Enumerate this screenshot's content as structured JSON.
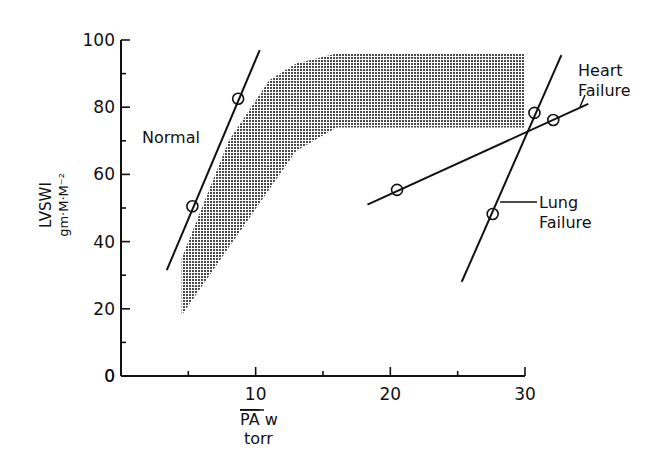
{
  "chart_data": {
    "type": "line",
    "title": "",
    "xlabel": "PA w",
    "xlabel_overline": "PA",
    "xlabel_unit": "torr",
    "ylabel": "LVSWI",
    "ylabel_unit": "gm·M·M⁻²",
    "xlim": [
      0,
      30
    ],
    "ylim": [
      0,
      100
    ],
    "x_ticks": [
      0,
      5,
      10,
      15,
      20,
      25,
      30
    ],
    "x_tick_labels": [
      "",
      "",
      "10",
      "",
      "20",
      "",
      "30"
    ],
    "y_ticks": [
      0,
      10,
      20,
      30,
      40,
      50,
      60,
      70,
      80,
      90,
      100
    ],
    "y_tick_labels": [
      "0",
      "",
      "20",
      "",
      "40",
      "",
      "60",
      "",
      "80",
      "",
      "100"
    ],
    "grid": false,
    "legend": "none (direct labels)",
    "shaded_region": {
      "description": "Normal range band (stippled)",
      "upper_boundary": [
        [
          4.5,
          35
        ],
        [
          8,
          70
        ],
        [
          11,
          88
        ],
        [
          13,
          93
        ],
        [
          16,
          96
        ],
        [
          30,
          96
        ]
      ],
      "lower_boundary": [
        [
          4.5,
          18
        ],
        [
          9,
          44
        ],
        [
          13,
          67
        ],
        [
          16,
          74
        ],
        [
          30,
          74
        ]
      ]
    },
    "series": [
      {
        "name": "Normal",
        "line": [
          [
            3.4,
            31.5
          ],
          [
            10.3,
            97
          ]
        ],
        "points": [
          [
            5.3,
            50.5
          ],
          [
            8.7,
            82.5
          ]
        ]
      },
      {
        "name": "Heart Failure",
        "line": [
          [
            18.3,
            51
          ],
          [
            34.7,
            81
          ]
        ],
        "points": [
          [
            20.5,
            55.4
          ],
          [
            32.1,
            76.2
          ]
        ]
      },
      {
        "name": "Lung Failure",
        "line": [
          [
            25.3,
            28
          ],
          [
            32.7,
            95.5
          ]
        ],
        "points": [
          [
            27.6,
            48.2
          ],
          [
            30.7,
            78.3
          ]
        ]
      }
    ],
    "annotations": [
      "Normal",
      "Heart",
      "Failure",
      "Lung",
      "Failure"
    ]
  },
  "labels": {
    "normal": "Normal",
    "heart_1": "Heart",
    "heart_2": "Failure",
    "lung_1": "Lung",
    "lung_2": "Failure",
    "ylabel": "LVSWI",
    "ylabel_unit": "gm·M·M⁻²",
    "xlabel_over": "PA",
    "xlabel_rest": " w",
    "xlabel_unit": "torr"
  },
  "colors": {
    "ink": "#111111",
    "stipple": "#555555"
  }
}
